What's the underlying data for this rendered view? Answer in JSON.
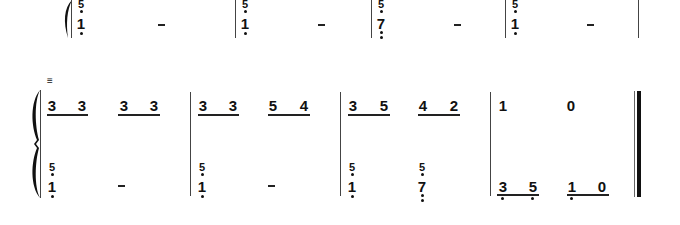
{
  "system1": {
    "measures": [
      {
        "upper": "",
        "lower": [
          "5 (low, stacked)",
          "1 (low)",
          "-"
        ]
      },
      {
        "upper": "",
        "lower": [
          "5 (low, stacked)",
          "1 (low)",
          "-"
        ]
      },
      {
        "upper": "",
        "lower": [
          "5 (low, stacked)",
          "7 (double low)",
          "-"
        ]
      },
      {
        "upper": "",
        "lower": [
          "5 (low, stacked)",
          "1 (low)",
          "-"
        ]
      }
    ],
    "glyphs": {
      "five": "5",
      "one": "1",
      "seven": "7",
      "dash": "–"
    }
  },
  "system2": {
    "tremolo_mark": "≡",
    "upper": [
      [
        "3",
        "3",
        "3",
        "3"
      ],
      [
        "3",
        "3",
        "5",
        "4"
      ],
      [
        "3",
        "5",
        "4",
        "2"
      ],
      [
        "1",
        "0"
      ]
    ],
    "lower": [
      {
        "chord_top": "5",
        "chord_bottom": "1",
        "rest": "–"
      },
      {
        "chord_top": "5",
        "chord_bottom": "1",
        "rest": "–"
      },
      {
        "chord_top": "5",
        "chord_bottom": "1",
        "second_top": "5",
        "second_bottom": "7"
      },
      {
        "notes": [
          "3",
          "5",
          "1",
          "0"
        ]
      }
    ]
  }
}
